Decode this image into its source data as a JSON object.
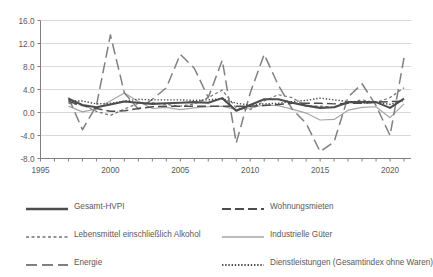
{
  "chart_data": {
    "type": "line",
    "title": "",
    "xlabel": "",
    "ylabel": "",
    "xlim": [
      1995,
      2021.5
    ],
    "ylim": [
      -8.0,
      16.0
    ],
    "grid": true,
    "legend_position": "bottom",
    "y_ticks": [
      "16.0",
      "12.0",
      "8.0",
      "4.0",
      "0.0",
      "-4.0",
      "-8.0"
    ],
    "y_tick_values": [
      16.0,
      12.0,
      8.0,
      4.0,
      0.0,
      -4.0,
      -8.0
    ],
    "x_ticks": [
      "1995",
      "2000",
      "2005",
      "2010",
      "2015",
      "2020"
    ],
    "x_tick_values": [
      1995,
      2000,
      2005,
      2010,
      2015,
      2020
    ],
    "x": [
      1997,
      1998,
      1999,
      2000,
      2001,
      2002,
      2003,
      2004,
      2005,
      2006,
      2007,
      2008,
      2009,
      2010,
      2011,
      2012,
      2013,
      2014,
      2015,
      2016,
      2017,
      2018,
      2019,
      2020,
      2021
    ],
    "series": [
      {
        "name": "Gesamt-HVPI",
        "style": "solid",
        "color": "#4d4d4d",
        "width": 2.1,
        "values": [
          2.4,
          1.3,
          0.9,
          1.4,
          1.9,
          1.7,
          1.5,
          1.6,
          1.7,
          1.8,
          1.7,
          2.5,
          0.3,
          1.3,
          2.3,
          2.3,
          1.7,
          1.2,
          0.8,
          0.9,
          1.8,
          1.8,
          1.8,
          0.8,
          2.4
        ]
      },
      {
        "name": "Wohnungsmieten",
        "style": "dashed-long",
        "color": "#4d4d4d",
        "width": 1.5,
        "values": [
          1.9,
          1.2,
          0.7,
          0.2,
          0.3,
          0.7,
          1.0,
          1.1,
          1.1,
          1.1,
          1.1,
          1.1,
          1.1,
          1.1,
          1.2,
          1.4,
          1.6,
          1.6,
          1.6,
          1.5,
          1.6,
          1.6,
          1.8,
          1.9,
          2.0
        ]
      },
      {
        "name": "Lebensmittel einschließlich Alkohol",
        "style": "dashed-short",
        "color": "#737373",
        "width": 1.2,
        "values": [
          1.6,
          1.3,
          0.2,
          -0.5,
          0.6,
          1.6,
          1.7,
          1.4,
          1.1,
          1.5,
          2.6,
          3.9,
          0.8,
          0.5,
          2.0,
          3.1,
          2.6,
          1.1,
          1.1,
          0.9,
          1.7,
          2.2,
          1.7,
          2.6,
          4.3
        ]
      },
      {
        "name": "Industrielle Güter",
        "style": "solid-thin",
        "color": "#a6a6a6",
        "width": 1.2,
        "values": [
          1.1,
          0.1,
          0.6,
          2.0,
          3.4,
          1.9,
          0.7,
          0.9,
          0.5,
          0.8,
          1.0,
          1.1,
          0.5,
          0.8,
          1.3,
          1.2,
          0.6,
          -0.1,
          -1.3,
          -1.2,
          0.4,
          0.9,
          1.0,
          -0.9,
          1.5
        ]
      },
      {
        "name": "Energie",
        "style": "dashed-xlong",
        "color": "#808080",
        "width": 1.5,
        "values": [
          2.6,
          -3.0,
          1.2,
          13.5,
          3.4,
          0.6,
          2.3,
          4.3,
          10.1,
          7.7,
          2.6,
          9.1,
          -5.3,
          3.4,
          10.1,
          4.8,
          0.6,
          -1.9,
          -6.8,
          -5.1,
          2.7,
          5.0,
          1.2,
          -4.0,
          9.5
        ]
      },
      {
        "name": "Dienstleistungen (Gesamtindex ohne Waren)",
        "style": "dotted",
        "color": "#4d4d4d",
        "width": 1.4,
        "values": [
          2.0,
          2.0,
          1.5,
          1.6,
          2.0,
          2.3,
          2.2,
          2.2,
          2.2,
          2.1,
          2.2,
          2.4,
          1.6,
          1.3,
          1.5,
          1.6,
          1.9,
          2.1,
          2.5,
          2.2,
          1.9,
          1.6,
          1.8,
          1.4,
          2.1
        ]
      }
    ]
  },
  "legend": {
    "entries": [
      {
        "label": "Gesamt-HVPI",
        "swatch": "solid"
      },
      {
        "label": "Wohnungsmieten",
        "swatch": "dashed-long"
      },
      {
        "label": "Lebensmittel einschließlich Alkohol",
        "swatch": "dashed-short"
      },
      {
        "label": "Industrielle Güter",
        "swatch": "solid-thin"
      },
      {
        "label": "Energie",
        "swatch": "dashed-xlong"
      },
      {
        "label": "Dienstleistungen (Gesamtindex ohne Waren)",
        "swatch": "dotted"
      }
    ]
  },
  "colors": {
    "grid": "#d9d9d9",
    "axis": "#808080",
    "text": "#595959",
    "background": "#ffffff"
  }
}
